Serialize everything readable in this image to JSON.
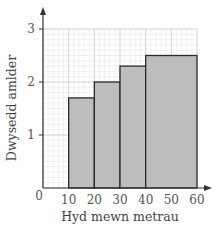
{
  "chart_data": {
    "type": "bar",
    "subtype": "histogram",
    "title": "",
    "xlabel": "Hyd mewn metrau",
    "ylabel": "Dwysedd amlder",
    "xlim": [
      0,
      60
    ],
    "ylim": [
      0,
      3
    ],
    "grid": true,
    "legend": null,
    "x_ticks": [
      "0",
      "10",
      "20",
      "30",
      "40",
      "50",
      "60"
    ],
    "y_ticks": [
      "1",
      "2",
      "3"
    ],
    "bins": [
      {
        "from": 10,
        "to": 20,
        "value": 1.7
      },
      {
        "from": 20,
        "to": 30,
        "value": 2.0
      },
      {
        "from": 30,
        "to": 40,
        "value": 2.3
      },
      {
        "from": 40,
        "to": 60,
        "value": 2.5
      }
    ],
    "categories": [
      "10-20",
      "20-30",
      "30-40",
      "40-60"
    ],
    "values": [
      1.7,
      2.0,
      2.3,
      2.5
    ]
  },
  "style": {
    "bar_fill": "#bdbdbd",
    "bar_stroke": "#2a2a2a",
    "grid_minor": "#e2e2e2",
    "grid_major": "#c4c4c4",
    "axis_color": "#333333"
  }
}
